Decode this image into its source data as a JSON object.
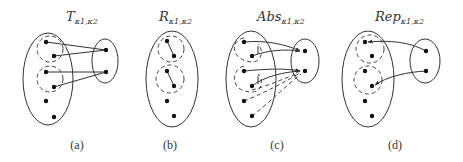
{
  "panels": [
    {
      "id": "a",
      "title_main": "T",
      "title_sub": "κ1,κ2",
      "caption": "(a)",
      "description": "Transition relation: clusters of source states map to target states"
    },
    {
      "id": "b",
      "title_main": "R",
      "title_sub": "κ1,κ2",
      "caption": "(b)",
      "description": "Relation within clusters of a single set"
    },
    {
      "id": "c",
      "title_main": "Abs",
      "title_sub": "κ1,κ2",
      "caption": "(c)",
      "description": "Abstraction: all source states mapped to abstract states"
    },
    {
      "id": "d",
      "title_main": "Rep",
      "title_sub": "κ1,κ2",
      "caption": "(d)",
      "description": "Representative: abstract states mapped back to representative concrete states"
    }
  ],
  "colors": {
    "stroke": "#333333",
    "dot": "#111111",
    "background": "#ffffff"
  }
}
